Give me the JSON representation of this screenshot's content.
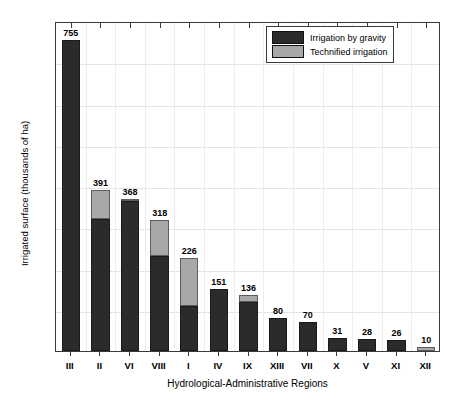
{
  "chart_data": {
    "type": "bar",
    "stacked": true,
    "title": "",
    "xlabel": "Hydrological-Administrative Regions",
    "ylabel": "Irrigated surface (thousands of ha)",
    "ylim": [
      0,
      800
    ],
    "yticks": [
      0,
      100,
      200,
      300,
      400,
      500,
      600,
      700,
      800
    ],
    "grid": true,
    "legend_position": "top-right",
    "categories": [
      "III",
      "II",
      "VI",
      "VIII",
      "I",
      "IV",
      "IX",
      "XIII",
      "VII",
      "X",
      "V",
      "XI",
      "XII"
    ],
    "totals": [
      755,
      391,
      368,
      318,
      226,
      151,
      136,
      80,
      70,
      31,
      28,
      26,
      10
    ],
    "data_labels": [
      "755",
      "391",
      "368",
      "318",
      "226",
      "151",
      "136",
      "80",
      "70",
      "31",
      "28",
      "26",
      "10"
    ],
    "series": [
      {
        "name": "Irrigation by gravity",
        "color": "#2b2b2b",
        "values": [
          755,
          320,
          363,
          230,
          110,
          151,
          118,
          80,
          70,
          31,
          28,
          26,
          0
        ]
      },
      {
        "name": "Technified irrigation",
        "color": "#a8a8a8",
        "values": [
          0,
          71,
          5,
          88,
          116,
          0,
          18,
          0,
          0,
          0,
          0,
          0,
          10
        ]
      }
    ]
  },
  "legend": {
    "entries": [
      {
        "label": "Irrigation by gravity",
        "color": "#2b2b2b"
      },
      {
        "label": "Technified irrigation",
        "color": "#a8a8a8"
      }
    ]
  },
  "axes": {
    "y_title": "Irrigated surface (thousands of ha)",
    "x_title": "Hydrological-Administrative Regions",
    "y_tick_labels": [
      "800",
      "700",
      "600",
      "500",
      "400",
      "300",
      "200",
      "100",
      "0"
    ],
    "x_tick_labels": [
      "III",
      "II",
      "VI",
      "VIII",
      "I",
      "IV",
      "IX",
      "XIII",
      "VII",
      "X",
      "V",
      "XI",
      "XII"
    ]
  }
}
